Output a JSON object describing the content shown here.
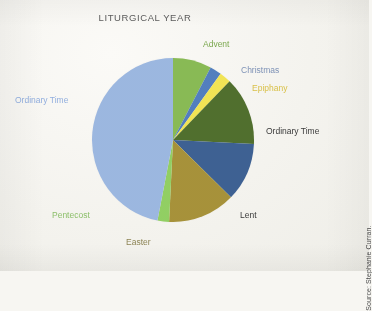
{
  "chart_title": "LITURGICAL YEAR",
  "source_credit": "Source: Stephanie Curran.",
  "labels": {
    "advent": "Advent",
    "christmas": "Christmas",
    "epiphany": "Epiphany",
    "ordinary_time_right": "Ordinary Time",
    "lent": "Lent",
    "easter": "Easter",
    "pentecost": "Pentecost",
    "ordinary_time_left": "Ordinary Time"
  },
  "chart_data": {
    "type": "pie",
    "title": "LITURGICAL YEAR",
    "subtitle": "",
    "xlabel": "",
    "ylabel": "",
    "grid": false,
    "legend_position": "none (labels placed around slices)",
    "units": "weeks of the liturgical year",
    "total": 52,
    "start_angle_deg": 0,
    "direction": "clockwise",
    "categories": [
      "Advent",
      "Christmas",
      "Epiphany",
      "Ordinary Time",
      "Lent",
      "Easter",
      "Pentecost",
      "Ordinary Time"
    ],
    "values": [
      4,
      1.2,
      1.2,
      7,
      6,
      7,
      1.2,
      24.4
    ],
    "percentages": [
      7.7,
      2.3,
      2.3,
      13.5,
      11.5,
      13.5,
      2.3,
      46.9
    ],
    "slice_colors": [
      "#86bb4f",
      "#4f7fc4",
      "#f2e44a",
      "#4f7029",
      "#3b6197",
      "#a89233",
      "#8fd05c",
      "#9ab7e3"
    ],
    "label_colors": [
      "#7ba84e",
      "#7e92b6",
      "#d9c14a",
      "#3a3a3a",
      "#3a3a3a",
      "#8d8455",
      "#8cbf6a",
      "#91aede"
    ],
    "annotations": [
      "Source: Stephanie Curran."
    ]
  }
}
